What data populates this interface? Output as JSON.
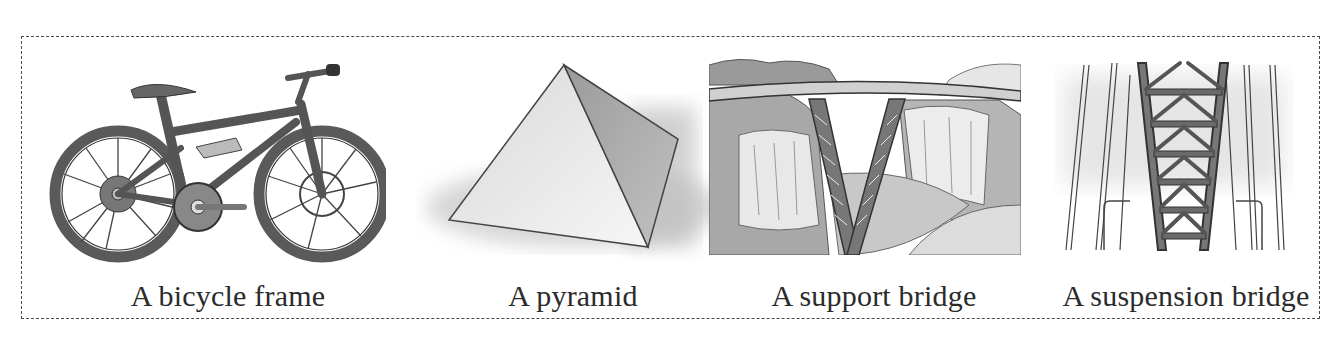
{
  "figure": {
    "items": [
      {
        "label": "A bicycle frame",
        "icon": "bicycle-illustration"
      },
      {
        "label": "A pyramid",
        "icon": "pyramid-illustration"
      },
      {
        "label": "A support bridge",
        "icon": "support-bridge-illustration"
      },
      {
        "label": "A suspension bridge",
        "icon": "suspension-bridge-illustration"
      }
    ]
  }
}
